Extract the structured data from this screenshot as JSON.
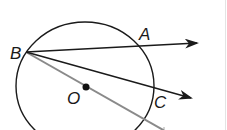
{
  "figure": {
    "type": "geometry-diagram",
    "colors": {
      "background": "#ffffff",
      "stroke": "#1a1a1a",
      "diameter_line": "#8a8a8a"
    },
    "circle": {
      "center_label": "O",
      "cx": 85,
      "cy": 86,
      "rx": 69,
      "ry": 64
    },
    "points": {
      "B": {
        "label": "B",
        "x": 26,
        "y": 52
      },
      "A": {
        "label": "A",
        "x": 137,
        "y": 45
      },
      "C": {
        "label": "C",
        "x": 151,
        "y": 89
      },
      "O": {
        "label": "O",
        "x": 85,
        "y": 87
      }
    },
    "rays": [
      {
        "name": "ray-BA",
        "from": "B",
        "through": "A",
        "end": [
          198,
          43
        ]
      },
      {
        "name": "ray-BC",
        "from": "B",
        "through": "C",
        "end": [
          192,
          98
        ]
      }
    ],
    "segments": [
      {
        "name": "line-B-through-O",
        "from": "B",
        "through": "O",
        "end": [
          165,
          130
        ]
      }
    ]
  },
  "labels": {
    "B": "B",
    "A": "A",
    "C": "C",
    "O": "O"
  }
}
